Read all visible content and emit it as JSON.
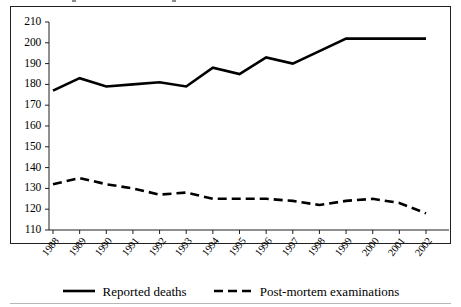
{
  "chart_data": {
    "type": "line",
    "title": "",
    "xlabel": "",
    "ylabel": "",
    "categories": [
      "1988",
      "1989",
      "1990",
      "1991",
      "1992",
      "1993",
      "1994",
      "1995",
      "1996",
      "1997",
      "1998",
      "1999",
      "2000",
      "2001",
      "2002"
    ],
    "ylim": [
      110,
      210
    ],
    "ytick_step": 10,
    "yticks": [
      110,
      120,
      130,
      140,
      150,
      160,
      170,
      180,
      190,
      200,
      210
    ],
    "grid": false,
    "legend_position": "bottom-center",
    "series": [
      {
        "name": "Reported deaths",
        "style": "solid",
        "color": "#000000",
        "values": [
          177,
          183,
          179,
          180,
          181,
          179,
          188,
          185,
          193,
          190,
          196,
          202,
          202,
          202,
          202
        ]
      },
      {
        "name": "Post-mortem examinations",
        "style": "dashed",
        "color": "#000000",
        "values": [
          132,
          135,
          132,
          130,
          127,
          128,
          125,
          125,
          125,
          124,
          122,
          124,
          125,
          123,
          118
        ]
      }
    ]
  },
  "legend": {
    "entries": [
      {
        "label": "Reported deaths",
        "style": "solid"
      },
      {
        "label": "Post-mortem examinations",
        "style": "dashed"
      }
    ]
  }
}
